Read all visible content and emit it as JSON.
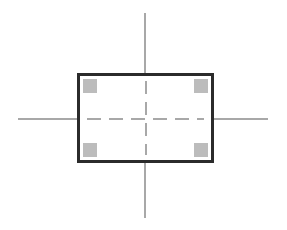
{
  "drawing": {
    "title": "Rectangular part outline with corner pads and centerlines",
    "canvas": {
      "width": 287,
      "height": 230,
      "background_color": "#ffffff"
    },
    "shapes": {
      "outline": {
        "name": "rectangle-outline",
        "x": 77,
        "y": 73,
        "width": 137,
        "height": 90,
        "stroke_color": "#2b2b2b",
        "stroke_width": 3,
        "fill_color": "#ffffff"
      },
      "corner_pads": {
        "name": "corner-pad",
        "count": 4,
        "size": 14,
        "fill_color": "#bcbcbc",
        "positions": [
          "top-left",
          "top-right",
          "bottom-left",
          "bottom-right"
        ]
      },
      "axes": {
        "color": "#a8a8a8",
        "stroke_width": 2,
        "vertical": {
          "x": 144,
          "y_start": 13,
          "y_end": 218
        },
        "horizontal": {
          "y": 118,
          "x_start": 18,
          "x_end": 268
        }
      },
      "centerlines": {
        "color": "#a8a8a8",
        "stroke_width": 2,
        "dash_length": 14,
        "gap_length": 8,
        "horizontal_y": 118,
        "vertical_x": 145
      }
    }
  }
}
